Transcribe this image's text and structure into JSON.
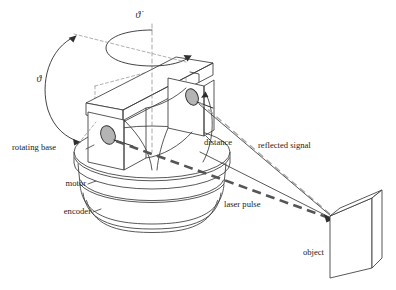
{
  "figure": {
    "background_color": "#ffffff",
    "line_color": "#3a3a3a"
  },
  "labels": {
    "rotating_base": "rotating base",
    "motor": "motor",
    "encoder": "encoder",
    "distance": "distance",
    "reflected_signal": "reflected signal",
    "laser_pulse": "laser pulse",
    "object": "object",
    "theta_tilt": "ϑ",
    "theta_rot_dot": "ϑ̇"
  },
  "annotations": {
    "tilt_angle_symbol": "ϑ",
    "rotation_rate_symbol": "ϑ̇",
    "beam_colors": {
      "laser_pulse": "#555555",
      "reflected_signal": "#a6a6a6"
    },
    "lens_color": "#b4b4b4"
  }
}
